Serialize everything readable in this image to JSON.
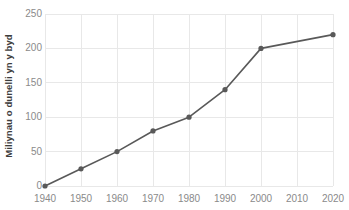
{
  "chart_data": {
    "type": "line",
    "title": "",
    "subtitle": "",
    "xlabel": "",
    "ylabel": "Miliynau o dunelli yn y byd",
    "x": [
      1940,
      1950,
      1960,
      1970,
      1980,
      1990,
      2000,
      2020
    ],
    "values": [
      0,
      25,
      50,
      80,
      100,
      140,
      200,
      220
    ],
    "series": [
      {
        "name": "Miliynau o dunelli yn y byd",
        "x": [
          1940,
          1950,
          1960,
          1970,
          1980,
          1990,
          2000,
          2020
        ],
        "values": [
          0,
          25,
          50,
          80,
          100,
          140,
          200,
          220
        ]
      }
    ],
    "xlim": [
      1940,
      2020
    ],
    "ylim": [
      0,
      250
    ],
    "x_ticks": [
      1940,
      1950,
      1960,
      1970,
      1980,
      1990,
      2000,
      2010,
      2020
    ],
    "x_tick_labels": [
      "1940",
      "1950",
      "1960",
      "1970",
      "1980",
      "1990",
      "2000",
      "2010",
      "2020"
    ],
    "y_ticks": [
      0,
      50,
      100,
      150,
      200,
      250
    ],
    "y_tick_labels": [
      "0",
      "50",
      "100",
      "150",
      "200",
      "250"
    ],
    "grid": true,
    "legend": false,
    "legend_position": "none",
    "markers": true,
    "annotations": [],
    "colors": {
      "line": "#595959",
      "marker": "#595959",
      "grid": "#e8e8e8",
      "axis_text": "#8a8a8a",
      "axis_title_text": "#3d3d3d",
      "background": "#ffffff"
    }
  }
}
